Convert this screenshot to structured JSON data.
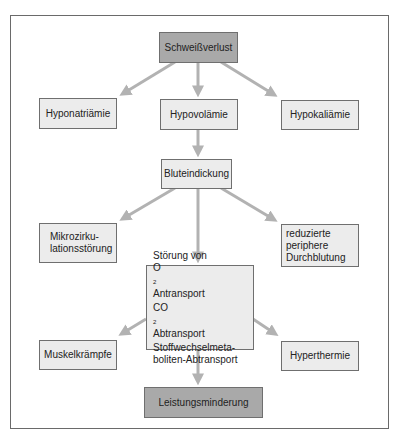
{
  "diagram": {
    "type": "flowchart",
    "colors": {
      "arrow": "#b2b2b2",
      "box_fill": "#ececec",
      "box_fill_emphasis": "#a9a9a9",
      "border": "#6f6f6f"
    },
    "nodes": {
      "root": {
        "label": "Schweißverlust"
      },
      "hyponatriaemie": {
        "label": "Hyponatriämie"
      },
      "hypovolaemie": {
        "label": "Hypovolämie"
      },
      "hypokaliaemie": {
        "label": "Hypokaliämie"
      },
      "bluteindickung": {
        "label": "Bluteindickung"
      },
      "mikrozirkulation": {
        "line1": "Mikrozirku-",
        "line2": "lationsstörung"
      },
      "durchblutung": {
        "line1": "reduzierte",
        "line2": "periphere",
        "line3": "Durchblutung"
      },
      "stoerung": {
        "line1": "Störung von",
        "line2_prefix": "O",
        "line2_sub": "2",
        "line2_suffix": " Antransport",
        "line3_prefix": "CO",
        "line3_sub": "2",
        "line3_suffix": " Abtransport",
        "line4": "Stoffwechselmeta-",
        "line5": "boliten-Abtransport"
      },
      "muskelkraempfe": {
        "label": "Muskelkrämpfe"
      },
      "hyperthermie": {
        "label": "Hyperthermie"
      },
      "leistungsminderung": {
        "label": "Leistungsminderung"
      }
    },
    "edges": [
      [
        "Schweißverlust",
        "Hyponatriämie"
      ],
      [
        "Schweißverlust",
        "Hypovolämie"
      ],
      [
        "Schweißverlust",
        "Hypokaliämie"
      ],
      [
        "Hypovolämie",
        "Bluteindickung"
      ],
      [
        "Bluteindickung",
        "Mikrozirkulationsstörung"
      ],
      [
        "Bluteindickung",
        "Störung von O2 Antransport / CO2 Abtransport / Stoffwechselmetaboliten-Abtransport"
      ],
      [
        "Bluteindickung",
        "reduzierte periphere Durchblutung"
      ],
      [
        "Störung",
        "Muskelkrämpfe"
      ],
      [
        "Störung",
        "Hyperthermie"
      ],
      [
        "Störung",
        "Leistungsminderung"
      ]
    ]
  }
}
